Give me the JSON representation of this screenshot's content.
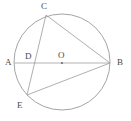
{
  "figure": {
    "canvas": {
      "width": 131,
      "height": 121
    },
    "background_color": "#ffffff",
    "stroke_color": "#9a9a9a",
    "diameter_stroke_color": "#b4b4b4",
    "label_color": "#4a4a4a",
    "circle": {
      "cx": 62,
      "cy": 62,
      "r": 48
    },
    "points": {
      "A": {
        "label": "A",
        "x": 14,
        "y": 63,
        "label_x": 5,
        "label_y": 58
      },
      "B": {
        "label": "B",
        "x": 110,
        "y": 63,
        "label_x": 117,
        "label_y": 58
      },
      "C": {
        "label": "C",
        "x": 46,
        "y": 15,
        "label_x": 41,
        "label_y": 2
      },
      "D": {
        "label": "D",
        "x": 31,
        "y": 63,
        "label_x": 25,
        "label_y": 52
      },
      "E": {
        "label": "E",
        "x": 27,
        "y": 95,
        "label_x": 17,
        "label_y": 101
      },
      "O": {
        "label": "O",
        "x": 62,
        "y": 63,
        "label_x": 58,
        "label_y": 51
      }
    },
    "segments": [
      {
        "name": "diameter-AB",
        "from": "A",
        "to": "B"
      },
      {
        "name": "chord-CE",
        "from": "C",
        "to": "E"
      },
      {
        "name": "chord-CB",
        "from": "C",
        "to": "B"
      },
      {
        "name": "chord-EB",
        "from": "E",
        "to": "B"
      }
    ],
    "center_marker": {
      "name": "center-dot",
      "x": 62,
      "y": 63,
      "r": 1.1
    }
  }
}
